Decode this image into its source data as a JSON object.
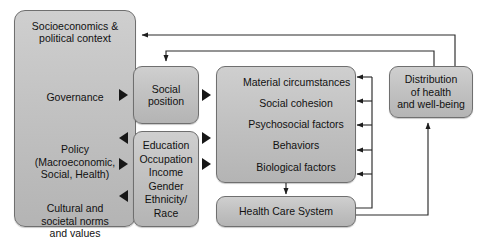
{
  "diagram": {
    "colors": {
      "node_fill_top": "#cfcfcf",
      "node_fill_bottom": "#b4b4b4",
      "node_border": "#6f6f6f",
      "connector": "#2b2b2b",
      "background": "#ffffff",
      "text": "#111111"
    }
  },
  "nodes": {
    "context": {
      "name": "socioeconomic-and-political-context",
      "segments": [
        {
          "lines": [
            "Socioeconomics &",
            "political context"
          ]
        },
        {
          "lines": [
            "Governance"
          ]
        },
        {
          "lines": [
            "Policy",
            "(Macroeconomic,",
            "Social, Health)"
          ]
        },
        {
          "lines": [
            "Cultural and",
            "societal norms",
            "and values"
          ]
        }
      ]
    },
    "social_position": {
      "name": "social-position",
      "lines": [
        "Social",
        "position"
      ]
    },
    "individual_position": {
      "name": "individual-social-position-factors",
      "lines": [
        "Education",
        "Occupation",
        "Income",
        "Gender",
        "Ethnicity/",
        "Race"
      ]
    },
    "determinants": {
      "name": "intermediary-determinants",
      "lines": [
        "Material circumstances",
        "Social cohesion",
        "Psychosocial factors",
        "Behaviors",
        "Biological factors"
      ]
    },
    "health_care_system": {
      "name": "health-care-system",
      "lines": [
        "Health Care System"
      ]
    },
    "distribution": {
      "name": "distribution-of-health",
      "lines": [
        "Distribution",
        "of health",
        "and well-being"
      ]
    }
  },
  "connectors": [
    {
      "name": "context-to-social-position",
      "from": "context",
      "to": "social_position",
      "style": "solid-triangle"
    },
    {
      "name": "context-to-individual-position",
      "from": "context",
      "to": "individual_position",
      "style": "solid-triangle"
    },
    {
      "name": "individual-position-to-context",
      "from": "individual_position",
      "to": "context",
      "style": "solid-triangle"
    },
    {
      "name": "social-position-to-determinants",
      "from": "social_position",
      "to": "determinants",
      "style": "solid-triangle"
    },
    {
      "name": "individual-position-to-determinants",
      "from": "individual_position",
      "to": "determinants",
      "style": "solid-triangle"
    },
    {
      "name": "determinants-to-health-care-system",
      "from": "determinants",
      "to": "health_care_system",
      "style": "line-arrow"
    },
    {
      "name": "health-care-system-to-determinants-feedback",
      "from": "health_care_system",
      "to": "determinants",
      "style": "line-arrow"
    },
    {
      "name": "health-care-system-to-distribution",
      "from": "health_care_system",
      "to": "distribution",
      "style": "line-arrow"
    },
    {
      "name": "distribution-to-context-feedback",
      "from": "distribution",
      "to": "context",
      "style": "line-arrow"
    },
    {
      "name": "distribution-to-social-position-feedback",
      "from": "distribution",
      "to": "social_position",
      "style": "line-arrow"
    }
  ]
}
